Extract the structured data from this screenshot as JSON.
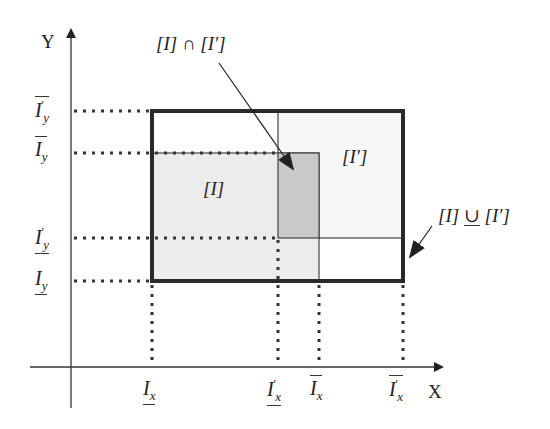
{
  "diagram": {
    "type": "interval-box-intersection-hull",
    "axes": {
      "x_label": "X",
      "y_label": "Y"
    },
    "y_ticks": [
      {
        "id": "upper_I_prime_y",
        "base": "I",
        "prime": "′",
        "sub": "y",
        "bar": "over",
        "y": 111
      },
      {
        "id": "upper_I_y",
        "base": "I",
        "prime": "",
        "sub": "y",
        "bar": "over",
        "y": 153
      },
      {
        "id": "lower_I_prime_y",
        "base": "I",
        "prime": "′",
        "sub": "y",
        "bar": "under",
        "y": 238
      },
      {
        "id": "lower_I_y",
        "base": "I",
        "prime": "",
        "sub": "y",
        "bar": "under",
        "y": 281
      }
    ],
    "x_ticks": [
      {
        "id": "lower_I_x",
        "base": "I",
        "prime": "",
        "sub": "x",
        "bar": "under",
        "x": 152
      },
      {
        "id": "lower_I_prime_x",
        "base": "I",
        "prime": "′",
        "sub": "x",
        "bar": "under",
        "x": 278
      },
      {
        "id": "upper_I_x",
        "base": "I",
        "prime": "",
        "sub": "x",
        "bar": "over",
        "x": 319
      },
      {
        "id": "upper_I_prime_x",
        "base": "I",
        "prime": "′",
        "sub": "x",
        "bar": "over",
        "x": 403
      }
    ],
    "regions": {
      "box_I": {
        "label": "[I]",
        "fill": "#ececec"
      },
      "box_I_prime": {
        "label": "[I′]",
        "fill": "#f7f7f7"
      },
      "intersection": {
        "label": "[I] ∩ [I′]",
        "fill": "#c9c9c9"
      },
      "hull": {
        "label": "[I] ∪̲ [I′]",
        "stroke": "#2a2a2a"
      }
    },
    "labels": {
      "box_I_text": "[I]",
      "box_I_prime_text": "[I′]",
      "intersection_left": "[I]",
      "intersection_op": "∩",
      "intersection_right": "[I′]",
      "hull_left": "[I]",
      "hull_op": "∪",
      "hull_right": "[I′]"
    }
  }
}
